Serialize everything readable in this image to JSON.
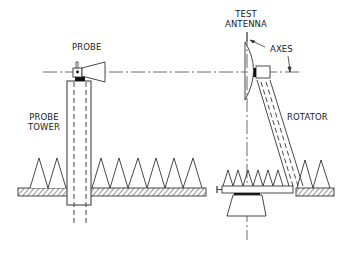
{
  "diagram": {
    "type": "antenna near-field measurement setup",
    "labels": {
      "probe": "PROBE",
      "probe_tower_line1": "PROBE",
      "probe_tower_line2": "TOWER",
      "test_antenna_line1": "TEST",
      "test_antenna_line2": "ANTENNA",
      "axes": "AXES",
      "rotator": "ROTATOR"
    },
    "components": [
      "probe",
      "probe-tower",
      "test-antenna",
      "rotator",
      "absorber-cones",
      "floor",
      "axes"
    ],
    "colors": {
      "line": "#333333",
      "background": "#ffffff"
    }
  }
}
